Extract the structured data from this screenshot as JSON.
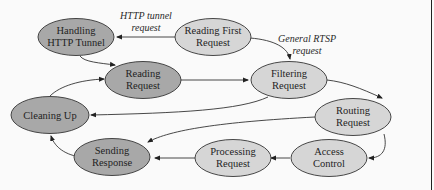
{
  "colors": {
    "dark_node": "#a8a8a8",
    "light_node": "#d6d6d6",
    "stroke": "#333333",
    "background": "#fafafa"
  },
  "nodes": [
    {
      "id": "handling_http_tunnel",
      "lines": [
        "Handling",
        "HTTP Tunnel"
      ],
      "shade": "dark",
      "cx": 76,
      "cy": 37
    },
    {
      "id": "reading_first_request",
      "lines": [
        "Reading First",
        "Request"
      ],
      "shade": "light",
      "cx": 213,
      "cy": 37
    },
    {
      "id": "reading_request",
      "lines": [
        "Reading",
        "Request"
      ],
      "shade": "dark",
      "cx": 143,
      "cy": 80
    },
    {
      "id": "filtering_request",
      "lines": [
        "Filtering",
        "Request"
      ],
      "shade": "light",
      "cx": 289,
      "cy": 80
    },
    {
      "id": "cleaning_up",
      "lines": [
        "Cleaning Up"
      ],
      "shade": "dark",
      "cx": 50,
      "cy": 115
    },
    {
      "id": "routing_request",
      "lines": [
        "Routing",
        "Request"
      ],
      "shade": "light",
      "cx": 353,
      "cy": 117
    },
    {
      "id": "sending_response",
      "lines": [
        "Sending",
        "Response"
      ],
      "shade": "dark",
      "cx": 112,
      "cy": 157
    },
    {
      "id": "processing_request",
      "lines": [
        "Processing",
        "Request"
      ],
      "shade": "light",
      "cx": 233,
      "cy": 158
    },
    {
      "id": "access_control",
      "lines": [
        "Access",
        "Control"
      ],
      "shade": "light",
      "cx": 329,
      "cy": 158
    }
  ],
  "edge_labels": {
    "http_tunnel": [
      "HTTP tunnel",
      "request"
    ],
    "general_rtsp": [
      "General RTSP",
      "request"
    ]
  },
  "edges": [
    {
      "from": "reading_first_request",
      "to": "handling_http_tunnel",
      "label": "HTTP tunnel request"
    },
    {
      "from": "reading_first_request",
      "to": "filtering_request",
      "label": "General RTSP request"
    },
    {
      "from": "handling_http_tunnel",
      "to": "reading_request"
    },
    {
      "from": "reading_request",
      "to": "filtering_request"
    },
    {
      "from": "cleaning_up",
      "to": "reading_request"
    },
    {
      "from": "filtering_request",
      "to": "routing_request"
    },
    {
      "from": "filtering_request",
      "to": "cleaning_up"
    },
    {
      "from": "routing_request",
      "to": "sending_response"
    },
    {
      "from": "routing_request",
      "to": "access_control"
    },
    {
      "from": "access_control",
      "to": "processing_request"
    },
    {
      "from": "processing_request",
      "to": "sending_response"
    },
    {
      "from": "sending_response",
      "to": "cleaning_up"
    }
  ]
}
